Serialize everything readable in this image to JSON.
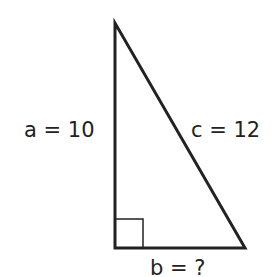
{
  "diagram": {
    "type": "right-triangle",
    "labels": {
      "a": "a = 10",
      "c": "c = 12",
      "b": "b = ?"
    },
    "stroke_color": "#222222"
  }
}
